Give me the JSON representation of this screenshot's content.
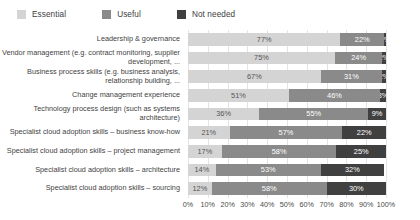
{
  "legend": {
    "position": "top-left",
    "items": [
      {
        "label": "Essential",
        "color": "#d4d4d4",
        "name": "legend-essential"
      },
      {
        "label": "Useful",
        "color": "#8a8a8a",
        "name": "legend-useful"
      },
      {
        "label": "Not needed",
        "color": "#404040",
        "name": "legend-not-needed"
      }
    ]
  },
  "axis": {
    "ticks": [
      "0%",
      "10%",
      "20%",
      "30%",
      "40%",
      "50%",
      "60%",
      "70%",
      "80%",
      "90%",
      "100%"
    ],
    "min": 0,
    "max": 100
  },
  "chart_data": {
    "type": "bar",
    "orientation": "horizontal",
    "stacked": true,
    "title": "",
    "xlabel": "",
    "ylabel": "",
    "xlim": [
      0,
      100
    ],
    "grid": true,
    "legend_position": "top-left",
    "categories": [
      "Leadership & governance",
      "Vendor management (e.g. contract monitoring, supplier development, ...",
      "Business process skills (e.g. business analysis, relationship building, ...",
      "Change management experience",
      "Technology process design (such as systems architecture)",
      "Specialist cloud adoption skills – business know-how",
      "Specialist cloud adoption skills – project management",
      "Specialist cloud adoption skills – architecture",
      "Specialist cloud adoption skills – sourcing"
    ],
    "series": [
      {
        "name": "Essential",
        "color": "#d4d4d4",
        "values": [
          77,
          75,
          67,
          51,
          36,
          21,
          17,
          14,
          12
        ]
      },
      {
        "name": "Useful",
        "color": "#8a8a8a",
        "values": [
          22,
          24,
          31,
          46,
          55,
          57,
          58,
          53,
          58
        ]
      },
      {
        "name": "Not needed",
        "color": "#404040",
        "values": [
          1,
          2,
          2,
          3,
          9,
          22,
          25,
          32,
          30
        ]
      }
    ],
    "data_labels": [
      {
        "essential": "77%",
        "useful": "22%",
        "not_needed": "1%"
      },
      {
        "essential": "75%",
        "useful": "24%",
        "not_needed": "2%"
      },
      {
        "essential": "67%",
        "useful": "31%",
        "not_needed": "2%"
      },
      {
        "essential": "51%",
        "useful": "46%",
        "not_needed": "3%"
      },
      {
        "essential": "36%",
        "useful": "55%",
        "not_needed": "9%"
      },
      {
        "essential": "21%",
        "useful": "57%",
        "not_needed": "22%"
      },
      {
        "essential": "17%",
        "useful": "58%",
        "not_needed": "25%"
      },
      {
        "essential": "14%",
        "useful": "53%",
        "not_needed": "32%"
      },
      {
        "essential": "12%",
        "useful": "58%",
        "not_needed": "30%"
      }
    ]
  }
}
